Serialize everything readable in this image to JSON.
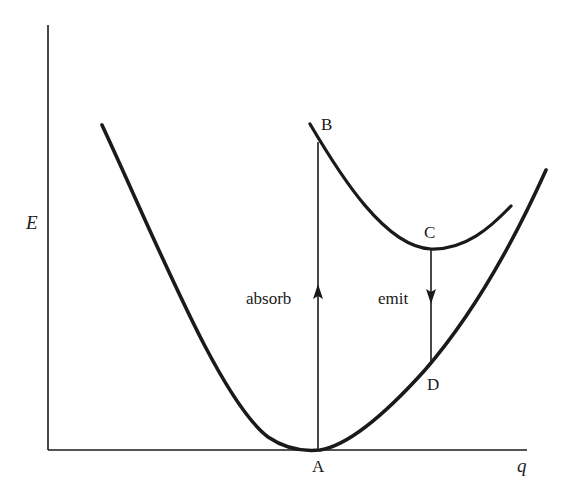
{
  "diagram": {
    "type": "potential-energy-curves",
    "axes": {
      "y_label": "E",
      "x_label": "q"
    },
    "points": {
      "A": "A",
      "B": "B",
      "C": "C",
      "D": "D"
    },
    "transitions": {
      "absorb": "absorb",
      "emit": "emit"
    },
    "colors": {
      "ink": "#1a1a1a",
      "background": "#ffffff"
    }
  }
}
